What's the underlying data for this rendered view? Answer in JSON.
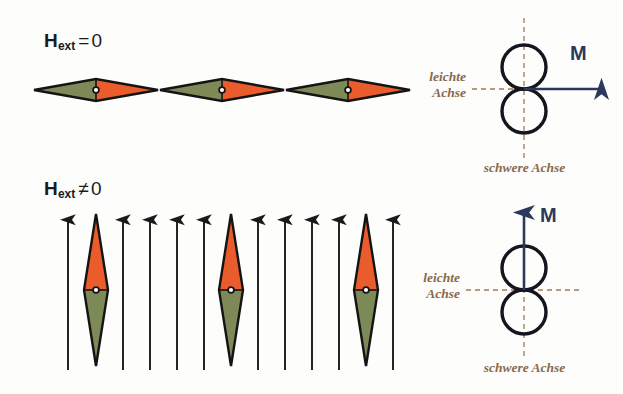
{
  "figure": {
    "title_absent": true,
    "width": 623,
    "height": 394,
    "background": "#ffffff"
  },
  "colors": {
    "green": "#7d8a58",
    "orange": "#ea5c2b",
    "outline": "#141414",
    "arrow_black": "#1a1a1a",
    "magnetization_blue": "#2b3a5c",
    "axis_brown": "#8a6a4a",
    "dot_white": "#ffffff"
  },
  "panels": {
    "top_left": {
      "field_label": {
        "symbol": "H",
        "subscript": "ext",
        "relation": "=",
        "value": "0"
      },
      "particle_count": 3,
      "particle_orientation": "horizontal",
      "particle_halves": [
        "green-left",
        "orange-right"
      ],
      "external_field_arrows": 0
    },
    "bottom_left": {
      "field_label": {
        "symbol": "H",
        "subscript": "ext",
        "relation": "≠",
        "value": "0"
      },
      "particle_count": 3,
      "particle_orientation": "vertical",
      "particle_halves": [
        "orange-top",
        "green-bottom"
      ],
      "external_field_arrows": 10,
      "arrow_direction": "up"
    },
    "top_right": {
      "easy_axis_label_line1": "leichte",
      "easy_axis_label_line2": "Achse",
      "hard_axis_label": "schwere Achse",
      "magnetization_label": "M",
      "magnetization_direction": "right",
      "lobes": 2,
      "lobe_orientation": "vertical-stack"
    },
    "bottom_right": {
      "easy_axis_label_line1": "leichte",
      "easy_axis_label_line2": "Achse",
      "hard_axis_label": "schwere Achse",
      "magnetization_label": "M",
      "magnetization_direction": "up",
      "lobes": 2,
      "lobe_orientation": "vertical-stack"
    }
  }
}
